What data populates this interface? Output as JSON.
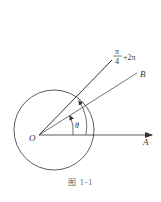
{
  "figure": {
    "caption": "图 1-1",
    "origin_label": "O",
    "ray_a_label": "A",
    "ray_b_label": "B",
    "angle_label": "θ",
    "terminal_label": {
      "numerator": "π",
      "denominator": "4",
      "suffix": "+2π"
    }
  },
  "colors": {
    "stroke": "#333333",
    "text": "#333333",
    "caption": "#666666",
    "background": "#ffffff"
  }
}
